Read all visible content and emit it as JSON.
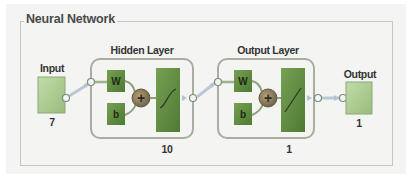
{
  "title": "Neural Network",
  "input": {
    "label": "Input",
    "size": "7"
  },
  "hidden_layer": {
    "label": "Hidden Layer",
    "size": "10",
    "weight": "W",
    "bias": "b",
    "sum": "+",
    "transfer": "tansig"
  },
  "output_layer": {
    "label": "Output Layer",
    "size": "1",
    "weight": "W",
    "bias": "b",
    "sum": "+",
    "transfer": "purelin"
  },
  "output": {
    "label": "Output",
    "size": "1"
  },
  "colors": {
    "io_block": "#a8c88e",
    "weight_block": "#5f8b3f",
    "transfer_block": "#5f8b3f",
    "sum_circle": "#7a7f5e",
    "layer_border": "#9da69a",
    "connector": "#a6b8c8"
  }
}
